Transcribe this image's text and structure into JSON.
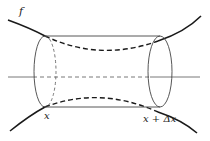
{
  "figure": {
    "type": "solid of revolution slice",
    "labels": {
      "function": "f",
      "left_bound": "x",
      "right_bound": "x + Δx"
    },
    "colors": {
      "stroke": "#1a1a1a",
      "thin_stroke": "#444444",
      "background": "#ffffff"
    }
  }
}
